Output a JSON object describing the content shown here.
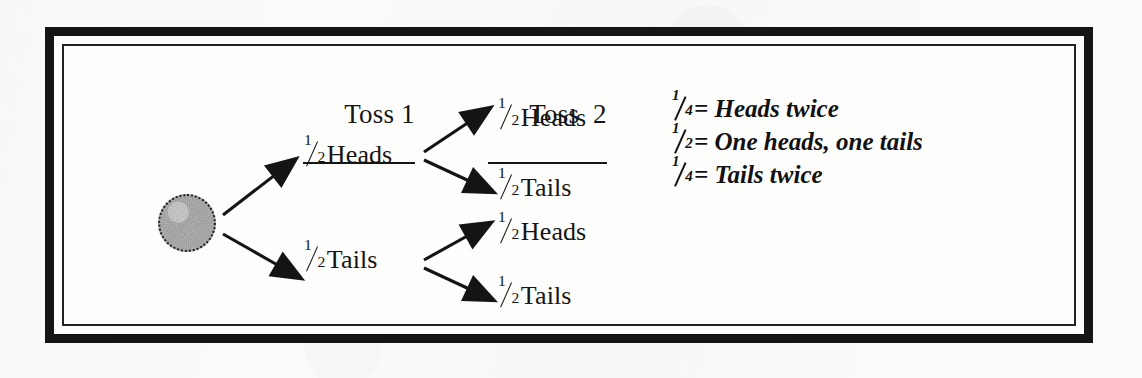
{
  "diagram": {
    "type": "probability-tree",
    "title_visible": false,
    "columns": [
      {
        "id": "toss1",
        "label": "Toss 1"
      },
      {
        "id": "toss2",
        "label": "Toss  2"
      }
    ],
    "root": {
      "shape": "circle",
      "fill": "#a8a8a8",
      "border": "dotted-black",
      "label": ""
    },
    "level1": [
      {
        "id": "h",
        "prob_num": "1",
        "prob_den": "2",
        "outcome": "Heads"
      },
      {
        "id": "t",
        "prob_num": "1",
        "prob_den": "2",
        "outcome": "Tails"
      }
    ],
    "level2": [
      {
        "id": "hh",
        "parent": "h",
        "prob_num": "1",
        "prob_den": "2",
        "outcome": "Heads"
      },
      {
        "id": "ht",
        "parent": "h",
        "prob_num": "1",
        "prob_den": "2",
        "outcome": "Tails"
      },
      {
        "id": "th",
        "parent": "t",
        "prob_num": "1",
        "prob_den": "2",
        "outcome": "Heads"
      },
      {
        "id": "tt",
        "parent": "t",
        "prob_num": "1",
        "prob_den": "2",
        "outcome": "Tails"
      }
    ],
    "legend": [
      {
        "prob_num": "1",
        "prob_den": "4",
        "equals": "=",
        "text": "Heads twice"
      },
      {
        "prob_num": "1",
        "prob_den": "2",
        "equals": "=",
        "text": "One heads, one tails"
      },
      {
        "prob_num": "1",
        "prob_den": "4",
        "equals": "=",
        "text": "Tails twice"
      }
    ],
    "colors": {
      "ink": "#151515",
      "node_fill": "#a8a8a8",
      "page": "#fbfbfa",
      "frame": "#151515"
    }
  }
}
